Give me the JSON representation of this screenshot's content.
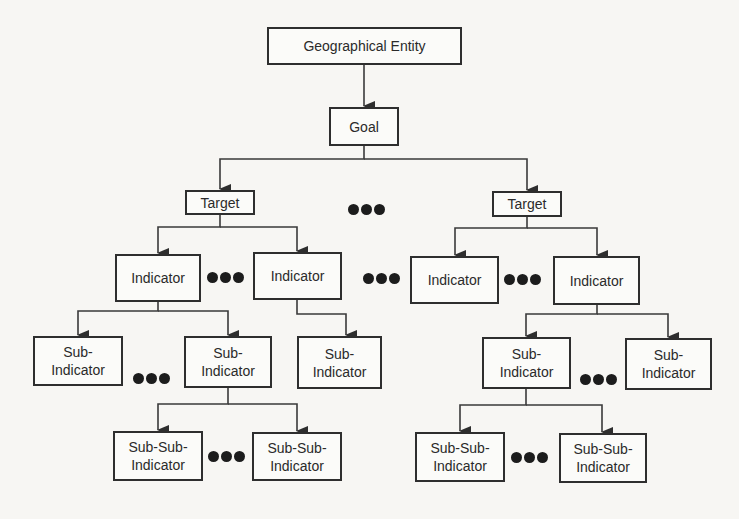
{
  "diagram": {
    "type": "hierarchy",
    "root": {
      "label": "Geographical Entity"
    },
    "goal": {
      "label": "Goal"
    },
    "targets": [
      {
        "label": "Target"
      },
      {
        "label": "Target"
      }
    ],
    "indicators": [
      {
        "label": "Indicator"
      },
      {
        "label": "Indicator"
      },
      {
        "label": "Indicator"
      },
      {
        "label": "Indicator"
      }
    ],
    "sub_indicators": [
      {
        "label": "Sub-\nIndicator"
      },
      {
        "label": "Sub-\nIndicator"
      },
      {
        "label": "Sub-\nIndicator"
      },
      {
        "label": "Sub-\nIndicator"
      },
      {
        "label": "Sub-\nIndicator"
      }
    ],
    "sub_sub_indicators": [
      {
        "label": "Sub-Sub-\nIndicator"
      },
      {
        "label": "Sub-Sub-\nIndicator"
      },
      {
        "label": "Sub-Sub-\nIndicator"
      },
      {
        "label": "Sub-Sub-\nIndicator"
      }
    ],
    "ellipsis_symbol": "●●●",
    "edges": [
      [
        "Geographical Entity",
        "Goal"
      ],
      [
        "Goal",
        "Target (left)"
      ],
      [
        "Goal",
        "Target (right)"
      ],
      [
        "Target (left)",
        "Indicator 1"
      ],
      [
        "Target (left)",
        "Indicator 2"
      ],
      [
        "Target (right)",
        "Indicator 3"
      ],
      [
        "Target (right)",
        "Indicator 4"
      ],
      [
        "Indicator 1",
        "Sub-Indicator 1"
      ],
      [
        "Indicator 1",
        "Sub-Indicator 2"
      ],
      [
        "Indicator 2",
        "Sub-Indicator 3"
      ],
      [
        "Indicator 4",
        "Sub-Indicator 4"
      ],
      [
        "Indicator 4",
        "Sub-Indicator 5"
      ],
      [
        "Sub-Indicator 2",
        "Sub-Sub-Indicator 1"
      ],
      [
        "Sub-Indicator 2",
        "Sub-Sub-Indicator 2"
      ],
      [
        "Sub-Indicator 4",
        "Sub-Sub-Indicator 3"
      ],
      [
        "Sub-Indicator 4",
        "Sub-Sub-Indicator 4"
      ]
    ]
  }
}
